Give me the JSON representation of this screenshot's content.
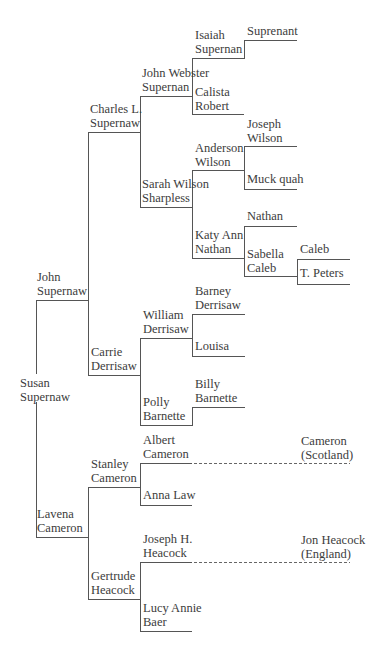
{
  "colors": {
    "line": "#555555",
    "text": "#3c3c3c",
    "background": "#ffffff"
  },
  "people": {
    "susan": {
      "line1": "Susan",
      "line2": "Supernaw"
    },
    "john": {
      "line1": "John",
      "line2": "Supernaw"
    },
    "lavena": {
      "line1": "Lavena",
      "line2": "Cameron"
    },
    "charles": {
      "line1": "Charles L.",
      "line2": "Supernaw"
    },
    "carrie": {
      "line1": "Carrie",
      "line2": "Derrisaw"
    },
    "stanley": {
      "line1": "Stanley",
      "line2": "Cameron"
    },
    "gertrude": {
      "line1": "Gertrude",
      "line2": "Heacock"
    },
    "johnweb": {
      "line1": "John Webster",
      "line2": "Supernan"
    },
    "sarah": {
      "line1": "Sarah Wilson",
      "line2": "Sharpless"
    },
    "william": {
      "line1": "William",
      "line2": "Derrisaw"
    },
    "polly": {
      "line1": "Polly",
      "line2": "Barnette"
    },
    "albert": {
      "line1": "Albert",
      "line2": "Cameron"
    },
    "anna": {
      "line1": "Anna Law"
    },
    "josephh": {
      "line1": "Joseph H.",
      "line2": "Heacock"
    },
    "lucy": {
      "line1": "Lucy Annie",
      "line2": "Baer"
    },
    "isaiah": {
      "line1": "Isaiah",
      "line2": "Supernan"
    },
    "calista": {
      "line1": "Calista",
      "line2": "Robert"
    },
    "anderson": {
      "line1": "Anderson",
      "line2": "Wilson"
    },
    "katy": {
      "line1": "Katy Ann",
      "line2": "Nathan"
    },
    "barney": {
      "line1": "Barney",
      "line2": "Derrisaw"
    },
    "louisa": {
      "line1": "Louisa"
    },
    "billy": {
      "line1": "Billy",
      "line2": "Barnette"
    },
    "suprenant": {
      "line1": "Suprenant"
    },
    "josephw": {
      "line1": "Joseph",
      "line2": "Wilson"
    },
    "muck": {
      "line1": "Muck quah"
    },
    "nathan": {
      "line1": "Nathan"
    },
    "sabella": {
      "line1": "Sabella",
      "line2": "Caleb"
    },
    "caleb": {
      "line1": "Caleb"
    },
    "tpeters": {
      "line1": "T. Peters"
    },
    "cameron": {
      "line1": "Cameron",
      "line2": "(Scotland)"
    },
    "jonheacock": {
      "line1": "Jon Heacock",
      "line2": "(England)"
    }
  }
}
